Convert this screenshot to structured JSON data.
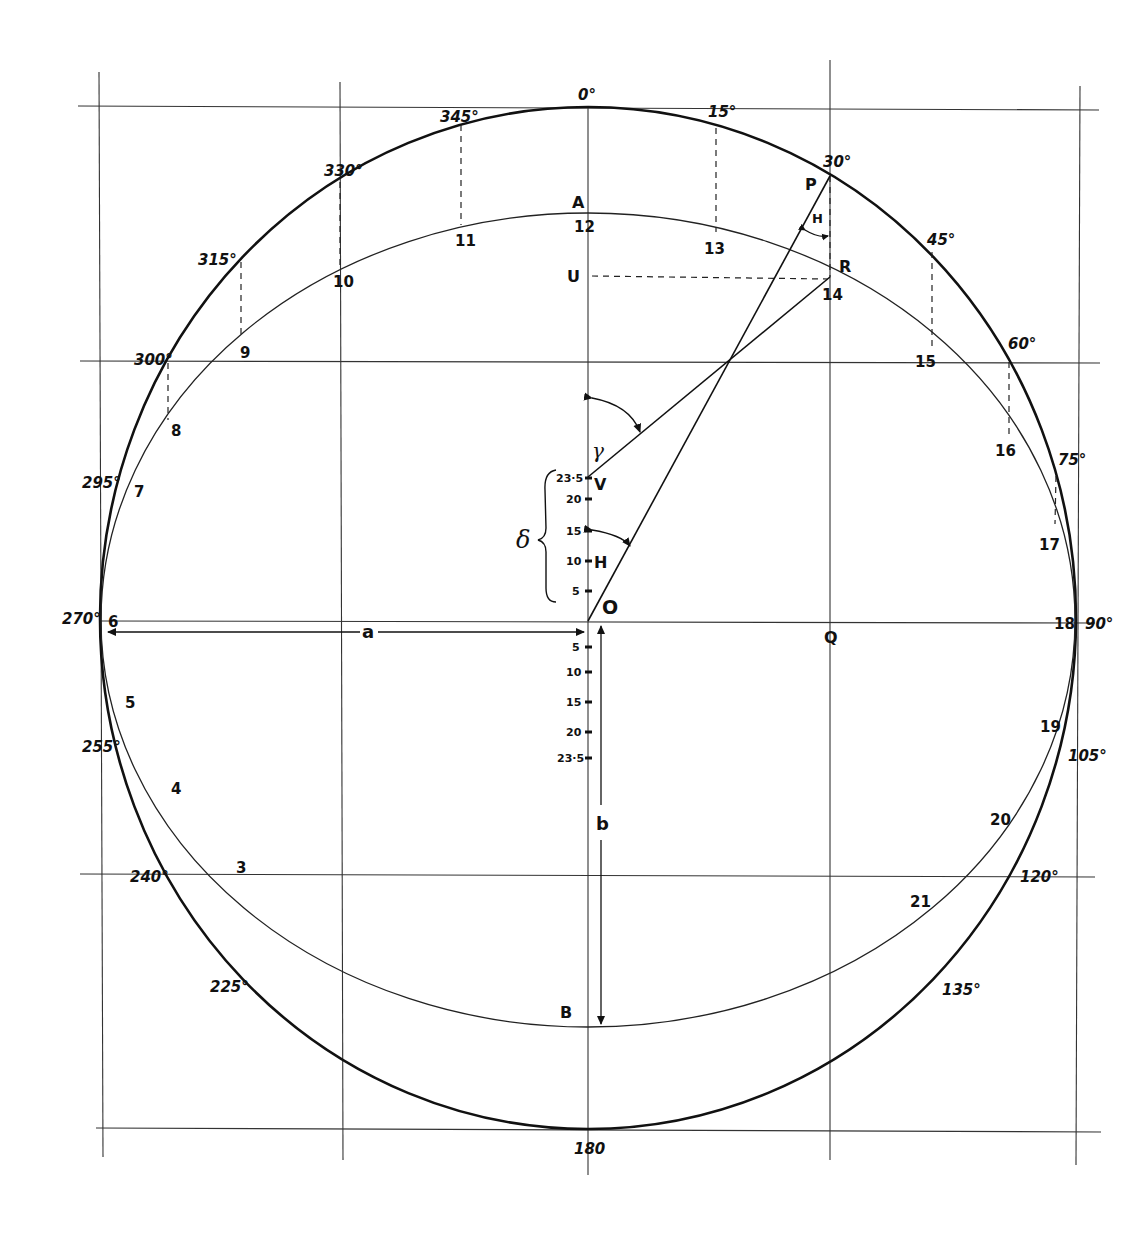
{
  "diagram": {
    "outer_circle_labels": [
      "0°",
      "15°",
      "30°",
      "45°",
      "60°",
      "75°",
      "90°",
      "105°",
      "120°",
      "135°",
      "180",
      "225°",
      "240°",
      "255°",
      "270°",
      "295°",
      "300°",
      "315°",
      "330°",
      "345°"
    ],
    "inner_ellipse_labels": [
      "3",
      "4",
      "5",
      "6",
      "7",
      "8",
      "9",
      "10",
      "11",
      "12",
      "13",
      "14",
      "15",
      "16",
      "17",
      "18",
      "19",
      "20",
      "21"
    ],
    "points": {
      "A": "A",
      "B": "B",
      "P": "P",
      "R": "R",
      "U": "U",
      "V": "V",
      "H": "H",
      "O": "O",
      "Q": "Q"
    },
    "angle_labels": {
      "hour_angle": "H",
      "gamma": "γ",
      "delta": "δ"
    },
    "axis_labels": {
      "a": "a",
      "b": "b"
    },
    "upper_scale": [
      "23·5",
      "20",
      "15",
      "10",
      "5"
    ],
    "lower_scale": [
      "5",
      "10",
      "15",
      "20",
      "23·5"
    ]
  },
  "labels": {
    "deg0": "0°",
    "deg15": "15°",
    "deg30": "30°",
    "deg45": "45°",
    "deg60": "60°",
    "deg75": "75°",
    "deg90": "90°",
    "deg105": "105°",
    "deg120": "120°",
    "deg135": "135°",
    "deg180": "180",
    "deg225": "225°",
    "deg240": "240°",
    "deg255": "255°",
    "deg270": "270°",
    "deg295": "295°",
    "deg300": "300°",
    "deg315": "315°",
    "deg330": "330°",
    "deg345": "345°",
    "h3": "3",
    "h4": "4",
    "h5": "5",
    "h6": "6",
    "h7": "7",
    "h8": "8",
    "h9": "9",
    "h10": "10",
    "h11": "11",
    "h12": "12",
    "h13": "13",
    "h14": "14",
    "h15": "15",
    "h16": "16",
    "h17": "17",
    "h18": "18",
    "h19": "19",
    "h20": "20",
    "h21": "21",
    "A": "A",
    "B": "B",
    "P": "P",
    "R": "R",
    "U": "U",
    "V": "V",
    "Hpt": "H",
    "O": "O",
    "Q": "Q",
    "Hangle": "H",
    "gamma": "γ",
    "delta": "δ",
    "a": "a",
    "b": "b",
    "up235": "23·5",
    "up20": "20",
    "up15": "15",
    "up10": "10",
    "up5": "5",
    "dn5": "5",
    "dn10": "10",
    "dn15": "15",
    "dn20": "20",
    "dn235": "23·5"
  }
}
